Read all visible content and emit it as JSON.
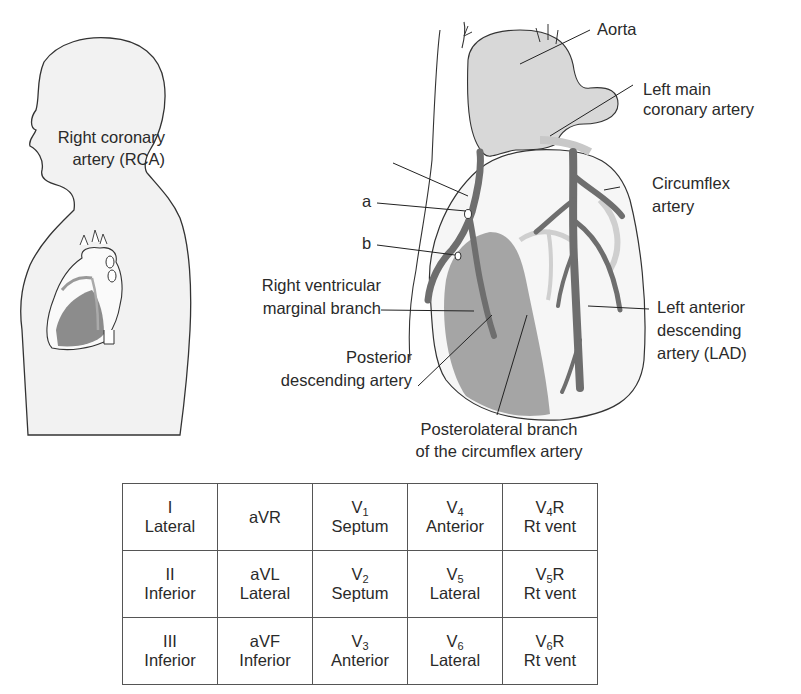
{
  "figure": {
    "left_panel": {
      "description": "Side-profile silhouette of a person with heart shown in chest"
    },
    "heart_labels": {
      "aorta": "Aorta",
      "left_main_1": "Left main",
      "left_main_2": "coronary artery",
      "circumflex_1": "Circumflex",
      "circumflex_2": "artery",
      "rca_1": "Right coronary",
      "rca_2": "artery (RCA)",
      "a": "a",
      "b": "b",
      "rv_marginal_1": "Right ventricular",
      "rv_marginal_2": "marginal branch",
      "pda_1": "Posterior",
      "pda_2": "descending artery",
      "lad_1": "Left anterior",
      "lad_2": "descending",
      "lad_3": "artery (LAD)",
      "posterolateral_1": "Posterolateral branch",
      "posterolateral_2": "of the circumflex artery"
    },
    "colors": {
      "silhouette_fill": "#f2f2f2",
      "outline": "#333333",
      "artery": "#6e6e6e",
      "ischemic_region": "#9a9a9a",
      "vessel_light": "#d4d4d4"
    }
  },
  "lead_table": {
    "rows": [
      [
        {
          "lead": "I",
          "sub": "",
          "suffix": "",
          "region": "Lateral"
        },
        {
          "lead": "aVR",
          "sub": "",
          "suffix": "",
          "region": ""
        },
        {
          "lead": "V",
          "sub": "1",
          "suffix": "",
          "region": "Septum"
        },
        {
          "lead": "V",
          "sub": "4",
          "suffix": "",
          "region": "Anterior"
        },
        {
          "lead": "V",
          "sub": "4",
          "suffix": "R",
          "region": "Rt vent"
        }
      ],
      [
        {
          "lead": "II",
          "sub": "",
          "suffix": "",
          "region": "Inferior"
        },
        {
          "lead": "aVL",
          "sub": "",
          "suffix": "",
          "region": "Lateral"
        },
        {
          "lead": "V",
          "sub": "2",
          "suffix": "",
          "region": "Septum"
        },
        {
          "lead": "V",
          "sub": "5",
          "suffix": "",
          "region": "Lateral"
        },
        {
          "lead": "V",
          "sub": "5",
          "suffix": "R",
          "region": "Rt vent"
        }
      ],
      [
        {
          "lead": "III",
          "sub": "",
          "suffix": "",
          "region": "Inferior"
        },
        {
          "lead": "aVF",
          "sub": "",
          "suffix": "",
          "region": "Inferior"
        },
        {
          "lead": "V",
          "sub": "3",
          "suffix": "",
          "region": "Anterior"
        },
        {
          "lead": "V",
          "sub": "6",
          "suffix": "",
          "region": "Lateral"
        },
        {
          "lead": "V",
          "sub": "6",
          "suffix": "R",
          "region": "Rt vent"
        }
      ]
    ]
  }
}
